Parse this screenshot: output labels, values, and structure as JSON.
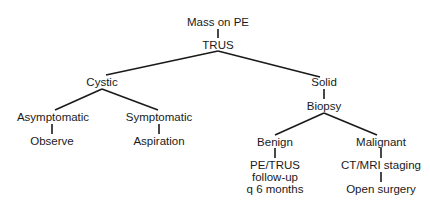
{
  "diagram": {
    "type": "flowchart-tree",
    "nodes": {
      "root": "Mass on PE",
      "trus": "TRUS",
      "cystic": "Cystic",
      "solid": "Solid",
      "asymptomatic": "Asymptomatic",
      "observe": "Observe",
      "symptomatic": "Symptomatic",
      "aspiration": "Aspiration",
      "biopsy": "Biopsy",
      "benign": "Benign",
      "benign_followup_1": "PE/TRUS",
      "benign_followup_2": "follow-up",
      "benign_followup_3": "q 6 months",
      "malignant": "Malignant",
      "staging": "CT/MRI staging",
      "surgery": "Open surgery"
    },
    "edges": [
      [
        "Mass on PE",
        "TRUS"
      ],
      [
        "TRUS",
        "Cystic"
      ],
      [
        "TRUS",
        "Solid"
      ],
      [
        "Cystic",
        "Asymptomatic"
      ],
      [
        "Cystic",
        "Symptomatic"
      ],
      [
        "Asymptomatic",
        "Observe"
      ],
      [
        "Symptomatic",
        "Aspiration"
      ],
      [
        "Solid",
        "Biopsy"
      ],
      [
        "Biopsy",
        "Benign"
      ],
      [
        "Biopsy",
        "Malignant"
      ],
      [
        "Benign",
        "PE/TRUS follow-up q 6 months"
      ],
      [
        "Malignant",
        "CT/MRI staging"
      ],
      [
        "CT/MRI staging",
        "Open surgery"
      ]
    ],
    "line_color": "#1a1a1a"
  }
}
